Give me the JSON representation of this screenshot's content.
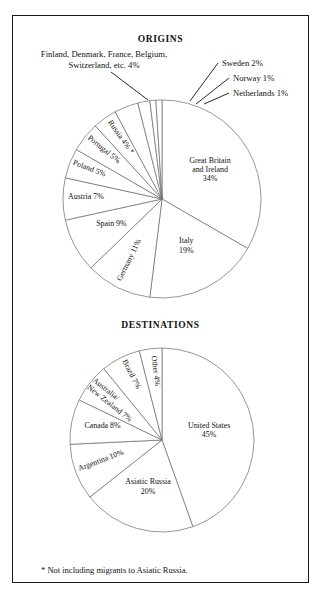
{
  "figure": {
    "footnote": "* Not including migrants to Asiatic Russia.",
    "border_color": "#1a1a1a",
    "slice_stroke_color": "#6a6a6a",
    "background": "#ffffff"
  },
  "chart_data": [
    {
      "type": "pie",
      "title": "ORIGINS",
      "center": {
        "x": 162,
        "y": 199
      },
      "radius": 99,
      "start_angle_deg": -90,
      "direction": "clockwise",
      "categories": [
        "Great Britain and Ireland",
        "Italy",
        "Germany",
        "Spain",
        "Austria",
        "Poland",
        "Portugal",
        "Russia",
        "Finland, Denmark, France, Belgium, Switzerland, etc.",
        "Sweden",
        "Norway",
        "Netherlands"
      ],
      "values": [
        34,
        19,
        11,
        9,
        7,
        5,
        5,
        4,
        4,
        2,
        1,
        1
      ],
      "slices": [
        {
          "label": "Great Britain and Ireland",
          "value": 34,
          "display": "Great Britain\nand Ireland\n34%",
          "label_lines": [
            "Great Britain",
            "and Ireland",
            "34%"
          ],
          "label_mode": "inside-horizontal"
        },
        {
          "label": "Italy",
          "value": 19,
          "display": "Italy\n19%",
          "label_lines": [
            "Italy",
            "19%"
          ],
          "label_mode": "inside-horizontal"
        },
        {
          "label": "Germany",
          "value": 11,
          "display": "Germany 11%",
          "label_lines": [
            "Germany 11%"
          ],
          "label_mode": "inside-radial"
        },
        {
          "label": "Spain",
          "value": 9,
          "display": "Spain 9%",
          "label_lines": [
            "Spain 9%"
          ],
          "label_mode": "inside-horizontal"
        },
        {
          "label": "Austria",
          "value": 7,
          "display": "Austria 7%",
          "label_lines": [
            "Austria 7%"
          ],
          "label_mode": "inside-radial"
        },
        {
          "label": "Poland",
          "value": 5,
          "display": "Poland 5%",
          "label_lines": [
            "Poland 5%"
          ],
          "label_mode": "inside-radial"
        },
        {
          "label": "Portugal",
          "value": 5,
          "display": "Portugal 5%",
          "label_lines": [
            "Portugal 5%"
          ],
          "label_mode": "inside-radial"
        },
        {
          "label": "Russia",
          "value": 4,
          "display": "Russia 4% *",
          "label_lines": [
            "Russia 4% *"
          ],
          "label_mode": "inside-radial"
        },
        {
          "label": "Finland, Denmark, France, Belgium, Switzerland, etc.",
          "value": 4,
          "display": "Finland, Denmark, France, Belgium, Switzerland, etc. 4%",
          "label_lines": [
            "Finland, Denmark, France, Belgium,",
            "Switzerland, etc. 4%"
          ],
          "label_mode": "callout"
        },
        {
          "label": "Sweden",
          "value": 2,
          "display": "Sweden 2%",
          "label_lines": [
            "Sweden 2%"
          ],
          "label_mode": "callout"
        },
        {
          "label": "Norway",
          "value": 1,
          "display": "Norway 1%",
          "label_lines": [
            "Norway 1%"
          ],
          "label_mode": "callout"
        },
        {
          "label": "Netherlands",
          "value": 1,
          "display": "Netherlands 1%",
          "label_lines": [
            "Netherlands 1%"
          ],
          "label_mode": "callout"
        }
      ],
      "unit": "%",
      "total": 102,
      "legend": "none",
      "grid": false
    },
    {
      "type": "pie",
      "title": "DESTINATIONS",
      "center": {
        "x": 162,
        "y": 440
      },
      "radius": 92,
      "start_angle_deg": -90,
      "direction": "clockwise",
      "categories": [
        "United States",
        "Asiatic Russia",
        "Argentina",
        "Canada",
        "Australia/New Zealand",
        "Brazil",
        "Other"
      ],
      "values": [
        45,
        20,
        10,
        8,
        7,
        7,
        4
      ],
      "slices": [
        {
          "label": "United States",
          "value": 45,
          "display": "United States\n45%",
          "label_lines": [
            "United States",
            "45%"
          ],
          "label_mode": "inside-horizontal"
        },
        {
          "label": "Asiatic Russia",
          "value": 20,
          "display": "Asiatic Russia\n20%",
          "label_lines": [
            "Asiatic Russia",
            "20%"
          ],
          "label_mode": "inside-horizontal"
        },
        {
          "label": "Argentina",
          "value": 10,
          "display": "Argentina 10%",
          "label_lines": [
            "Argentina 10%"
          ],
          "label_mode": "inside-radial"
        },
        {
          "label": "Canada",
          "value": 8,
          "display": "Canada 8%",
          "label_lines": [
            "Canada 8%"
          ],
          "label_mode": "inside-horizontal"
        },
        {
          "label": "Australia/New Zealand",
          "value": 7,
          "display": "Australia/ New Zealand 7%",
          "label_lines": [
            "Australia/",
            "New Zealand  7%"
          ],
          "label_mode": "inside-radial"
        },
        {
          "label": "Brazil",
          "value": 7,
          "display": "Brazil 7%",
          "label_lines": [
            "Brazil 7%"
          ],
          "label_mode": "inside-radial"
        },
        {
          "label": "Other",
          "value": 4,
          "display": "Other 4%",
          "label_lines": [
            "Other 4%"
          ],
          "label_mode": "inside-radial"
        }
      ],
      "unit": "%",
      "total": 101,
      "legend": "none",
      "grid": false
    }
  ]
}
